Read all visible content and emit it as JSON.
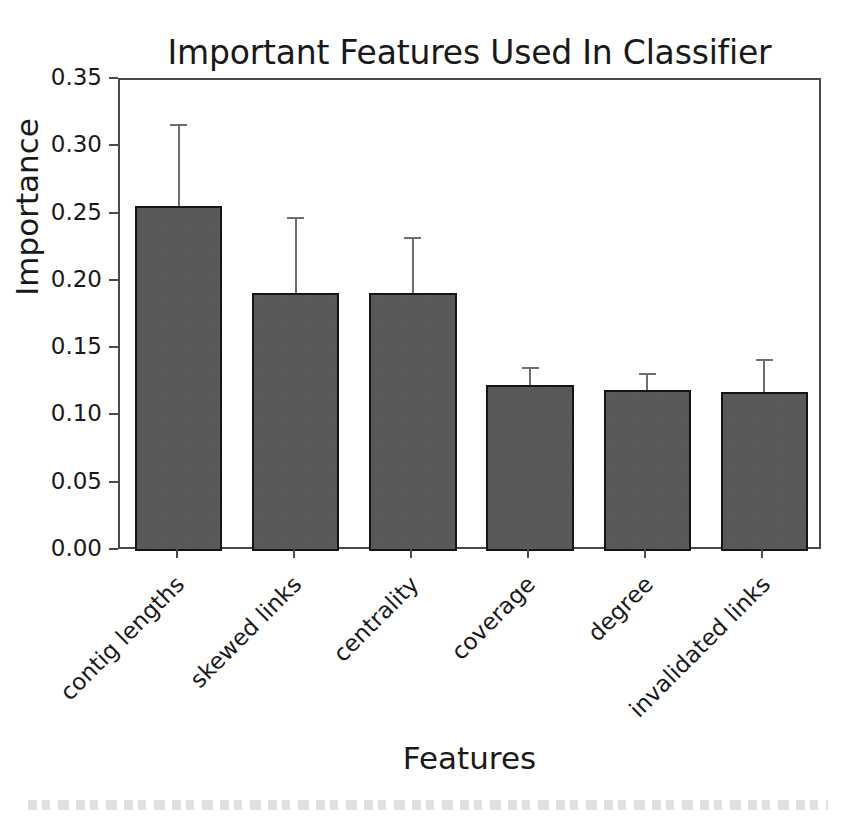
{
  "chart_data": {
    "type": "bar",
    "title": "Important Features Used In Classifier",
    "xlabel": "Features",
    "ylabel": "Importance",
    "categories": [
      "contig lengths",
      "skewed links",
      "centrality",
      "coverage",
      "degree",
      "invalidated links"
    ],
    "values": [
      0.256,
      0.192,
      0.192,
      0.123,
      0.12,
      0.118
    ],
    "error_upper": [
      0.317,
      0.248,
      0.233,
      0.137,
      0.132,
      0.143
    ],
    "errors": [
      0.061,
      0.056,
      0.041,
      0.014,
      0.012,
      0.025
    ],
    "ylim": [
      0.0,
      0.35
    ],
    "ytick_values": [
      0.0,
      0.05,
      0.1,
      0.15,
      0.2,
      0.25,
      0.3,
      0.35
    ],
    "ytick_labels": [
      "0.00",
      "0.05",
      "0.10",
      "0.15",
      "0.20",
      "0.25",
      "0.30",
      "0.35"
    ],
    "grid": false,
    "legend": false,
    "legend_position": "none",
    "xtick_rotation": -45,
    "bar_color": "#565656",
    "bar_edge_color": "#151515",
    "error_color": "#6e6e6e",
    "axis_color": "#4a4a4a",
    "text_color": "#191919",
    "background": "#ffffff"
  }
}
